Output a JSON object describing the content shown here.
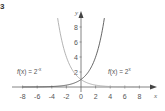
{
  "figure": {
    "corner_label": "3"
  },
  "chart_data": {
    "type": "line",
    "title": "",
    "xlabel": "x",
    "ylabel": "y",
    "xlim": [
      -9,
      9
    ],
    "ylim": [
      0,
      9
    ],
    "x_ticks": [
      -8,
      -6,
      -4,
      -2,
      0,
      2,
      4,
      6,
      8
    ],
    "x_tick_labels": [
      "-8",
      "-6",
      "-4",
      "-2",
      "0",
      "2",
      "4",
      "6",
      "8"
    ],
    "y_ticks": [
      2,
      4,
      6,
      8
    ],
    "y_tick_labels": [
      "2",
      "4",
      "6",
      "8"
    ],
    "grid": false,
    "legend": "inline annotations",
    "series": [
      {
        "name": "f(x) = 2^-x",
        "label_text": "f(x) = 2",
        "label_exp": "-x",
        "color": "#aaaaaa",
        "x": [
          -3.2,
          -3,
          -2.5,
          -2,
          -1.5,
          -1,
          -0.5,
          0,
          1,
          2,
          3,
          4,
          5,
          6,
          7,
          8
        ],
        "y": [
          9.19,
          8,
          5.66,
          4,
          2.83,
          2,
          1.41,
          1,
          0.5,
          0.25,
          0.125,
          0.0625,
          0.031,
          0.016,
          0.008,
          0.004
        ]
      },
      {
        "name": "f(x) = 2^x",
        "label_text": "f(x) = 2",
        "label_exp": "x",
        "color": "#555555",
        "x": [
          -8,
          -7,
          -6,
          -5,
          -4,
          -3,
          -2,
          -1,
          0,
          0.5,
          1,
          1.5,
          2,
          2.5,
          3,
          3.2
        ],
        "y": [
          0.004,
          0.008,
          0.016,
          0.031,
          0.0625,
          0.125,
          0.25,
          0.5,
          1,
          1.41,
          2,
          2.83,
          4,
          5.66,
          8,
          9.19
        ]
      }
    ]
  }
}
